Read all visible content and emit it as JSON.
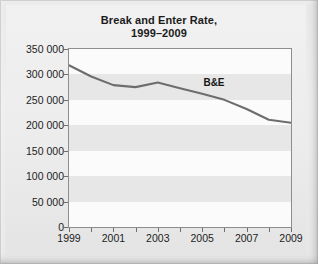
{
  "title": {
    "line1": "Break and Enter Rate,",
    "line2": "1999–2009"
  },
  "colors": {
    "page_background": "#e9e9e9",
    "plot_background": "#fbfbfb",
    "band": "#e7e7e7",
    "line": "#6d6d6d",
    "axis": "#8e8e8e",
    "text": "#1d1d1d"
  },
  "chart_data": {
    "type": "line",
    "title": "Break and Enter Rate, 1999–2009",
    "xlabel": "",
    "ylabel": "",
    "x": [
      1999,
      2000,
      2001,
      2002,
      2003,
      2004,
      2005,
      2006,
      2007,
      2008,
      2009
    ],
    "series": [
      {
        "name": "B&E",
        "values": [
          318000,
          296000,
          279000,
          275000,
          284000,
          273000,
          262000,
          250000,
          232000,
          211000,
          205000
        ]
      }
    ],
    "xlim": [
      1999,
      2009
    ],
    "ylim": [
      0,
      350000
    ],
    "ytick_values": [
      0,
      50000,
      100000,
      150000,
      200000,
      250000,
      300000,
      350000
    ],
    "ytick_labels": [
      "0",
      "50 000",
      "100 000",
      "150 000",
      "200 000",
      "250 000",
      "300 000",
      "350 000"
    ],
    "xtick_values": [
      1999,
      2000,
      2001,
      2002,
      2003,
      2004,
      2005,
      2006,
      2007,
      2008,
      2009
    ],
    "xtick_labels": [
      "1999",
      "",
      "2001",
      "",
      "2003",
      "",
      "2005",
      "",
      "2007",
      "",
      "2009"
    ],
    "grid": false,
    "banded_background": true,
    "band_interval": 50000,
    "legend_position": "inline",
    "annotations": [
      {
        "text": "B&E",
        "x": 2005.1,
        "y": 292000
      }
    ]
  }
}
